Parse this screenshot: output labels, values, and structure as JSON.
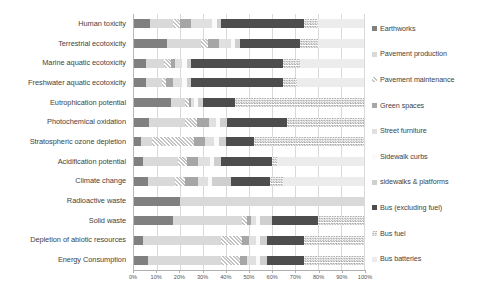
{
  "chart_data": {
    "type": "bar",
    "subtype": "100% stacked horizontal bar",
    "title": "",
    "xlabel": "",
    "ylabel": "",
    "xlim": [
      0,
      100
    ],
    "grid": true,
    "legend_position": "right",
    "xticks": [
      "0%",
      "10%",
      "20%",
      "30%",
      "40%",
      "50%",
      "60%",
      "70%",
      "80%",
      "90%",
      "100%"
    ],
    "xtick_values": [
      0,
      10,
      20,
      30,
      40,
      50,
      60,
      70,
      80,
      90,
      100
    ],
    "categories": [
      "Human toxicity",
      "Terrestrial ecotoxicity",
      "Marine aquatic ecotoxicity",
      "Freshwater aquatic ecotoxicity",
      "Eutrophication potential",
      "Photochemical oxidation",
      "Stratospheric ozone depletion",
      "Acidification potential",
      "Climate change",
      "Radioactive waste",
      "Solid waste",
      "Depletion of abiotic resources",
      "Energy Consumption"
    ],
    "series": [
      {
        "name": "Earthworks",
        "fill": "solid",
        "color": "#808080",
        "values": [
          7.0,
          14.5,
          5.0,
          5.0,
          16.0,
          6.5,
          3.0,
          4.0,
          6.0,
          20.0,
          17.0,
          4.0,
          6.0
        ]
      },
      {
        "name": "Pavement production",
        "fill": "solid",
        "color": "#d9d9d9",
        "values": [
          10.0,
          14.5,
          8.0,
          7.0,
          6.0,
          15.5,
          5.0,
          15.0,
          12.0,
          80.0,
          30.0,
          34.0,
          32.0
        ]
      },
      {
        "name": "Pavement maintenance",
        "fill": "diagonal-stripe",
        "color": "#c4c4c4",
        "values": [
          3.0,
          3.0,
          3.0,
          2.0,
          2.0,
          5.5,
          18.0,
          4.0,
          4.0,
          0.0,
          2.0,
          9.0,
          8.0
        ]
      },
      {
        "name": "Green spaces",
        "fill": "solid",
        "color": "#a6a6a6",
        "values": [
          5.0,
          5.0,
          2.0,
          3.0,
          1.0,
          5.0,
          5.0,
          5.0,
          6.0,
          0.0,
          2.0,
          3.0,
          3.0
        ]
      },
      {
        "name": "Street furniture",
        "fill": "solid",
        "color": "#e0e0e0",
        "values": [
          9.0,
          5.0,
          3.0,
          4.0,
          1.0,
          3.0,
          4.0,
          5.0,
          4.0,
          0.0,
          2.0,
          3.0,
          4.0
        ]
      },
      {
        "name": "Sidewalk curbs",
        "fill": "solid",
        "color": "#fafafa",
        "values": [
          2.0,
          2.0,
          2.0,
          2.0,
          2.0,
          2.0,
          2.0,
          2.0,
          2.0,
          0.0,
          2.0,
          2.0,
          2.0
        ]
      },
      {
        "name": "sidewalks & platforms",
        "fill": "solid",
        "color": "#cfcfcf",
        "values": [
          2.0,
          2.0,
          2.0,
          2.0,
          2.0,
          3.0,
          3.0,
          3.0,
          8.0,
          0.0,
          5.0,
          3.0,
          3.0
        ]
      },
      {
        "name": "Bus (excluding fuel)",
        "fill": "solid",
        "color": "#4d4d4d",
        "values": [
          36.0,
          26.0,
          40.0,
          40.0,
          14.0,
          26.0,
          12.0,
          22.0,
          17.0,
          0.0,
          20.0,
          16.0,
          16.0
        ]
      },
      {
        "name": "Bus fuel",
        "fill": "checkerboard",
        "color": "#a8a8a8",
        "values": [
          6.0,
          8.0,
          7.0,
          6.0,
          56.0,
          33.5,
          48.0,
          2.0,
          6.0,
          0.0,
          20.0,
          26.0,
          26.0
        ]
      },
      {
        "name": "Bus batteries",
        "fill": "solid",
        "color": "#ececec",
        "values": [
          20.0,
          20.0,
          28.0,
          29.0,
          0.0,
          0.0,
          0.0,
          38.0,
          35.0,
          0.0,
          0.0,
          0.0,
          0.0
        ]
      }
    ]
  },
  "legend": {
    "items": [
      {
        "label": "Earthworks"
      },
      {
        "label": "Pavement production"
      },
      {
        "label": "Pavement maintenance"
      },
      {
        "label": "Green spaces"
      },
      {
        "label": "Street furniture"
      },
      {
        "label": "Sidewalk curbs"
      },
      {
        "label": "sidewalks & platforms"
      },
      {
        "label": "Bus (excluding fuel)"
      },
      {
        "label": "Bus fuel"
      },
      {
        "label": "Bus batteries"
      }
    ]
  },
  "axis": {
    "left_border_color": "#b8b8b8",
    "grid_color": "#d9d9d9",
    "tick_color": "#b0b0b0"
  }
}
